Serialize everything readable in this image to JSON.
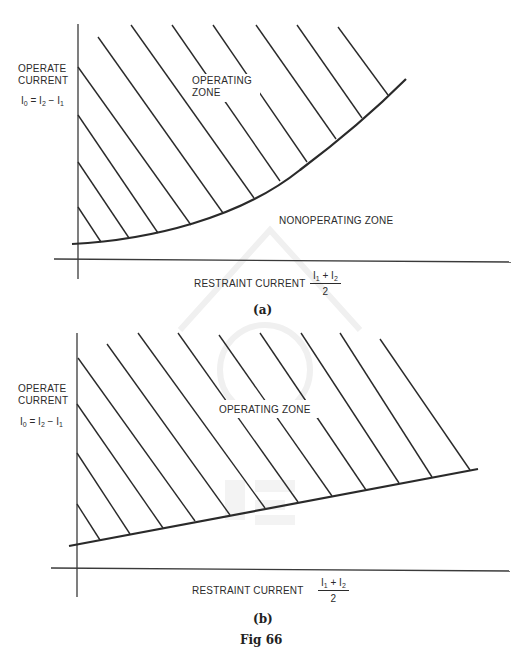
{
  "figure": {
    "caption": "Fig 66",
    "panels": [
      {
        "id": "a",
        "label": "(a)",
        "y_axis_label_line1": "OPERATE",
        "y_axis_label_line2": "CURRENT",
        "y_eq": {
          "lhs": "I",
          "lhs_sub": "0",
          "mid": " = I",
          "mid_sub": "2",
          "rhs": " − I",
          "rhs_sub": "1"
        },
        "x_axis_label": "RESTRAINT CURRENT",
        "x_frac": {
          "a": "I",
          "a_sub": "1",
          "op": " + I",
          "b_sub": "2",
          "den": "2"
        },
        "zone_label_line1": "OPERATING",
        "zone_label_line2": "ZONE",
        "non_zone_label": "NONOPERATING ZONE",
        "boundary_type": "curve"
      },
      {
        "id": "b",
        "label": "(b)",
        "y_axis_label_line1": "OPERATE",
        "y_axis_label_line2": "CURRENT",
        "y_eq": {
          "lhs": "I",
          "lhs_sub": "0",
          "mid": " = I",
          "mid_sub": "2",
          "rhs": " − I",
          "rhs_sub": "1"
        },
        "x_axis_label": "RESTRAINT CURRENT",
        "x_frac": {
          "a": "I",
          "a_sub": "1",
          "op": " + I",
          "b_sub": "2",
          "den": "2"
        },
        "zone_label": "OPERATING ZONE",
        "boundary_type": "straight line"
      }
    ]
  },
  "geometry": {
    "a": {
      "y_axis": [
        78,
        24,
        78,
        279
      ],
      "x_axis": [
        54,
        259,
        511,
        262
      ],
      "boundary_path": "M72,244 C150,240 240,218 300,170 C340,140 375,110 406,79",
      "hatch": [
        [
          78,
          207,
          101,
          242
        ],
        [
          78,
          162,
          129,
          238
        ],
        [
          78,
          115,
          158,
          233
        ],
        [
          78,
          67,
          191,
          225
        ],
        [
          98,
          37,
          223,
          213
        ],
        [
          131,
          25,
          254,
          198
        ],
        [
          172,
          25,
          280,
          181
        ],
        [
          213,
          25,
          307,
          162
        ],
        [
          256,
          25,
          336,
          139
        ],
        [
          297,
          25,
          362,
          118
        ],
        [
          338,
          27,
          388,
          95
        ]
      ],
      "hatch_gaps": [
        [
          [
            172,
            25,
            280,
            181
          ],
          [
            206,
            72,
            228,
            104
          ]
        ],
        [
          [
            213,
            25,
            307,
            162
          ],
          [
            208,
            31,
            228,
            60
          ]
        ]
      ]
    },
    "b": {
      "y_axis": [
        77,
        333,
        77,
        597
      ],
      "x_axis": [
        51,
        568,
        510,
        571
      ],
      "boundary": [
        69,
        546,
        478,
        469
      ],
      "hatch": [
        [
          77,
          504,
          100,
          540
        ],
        [
          77,
          453,
          130,
          534
        ],
        [
          77,
          404,
          163,
          528
        ],
        [
          78,
          358,
          195,
          521
        ],
        [
          107,
          344,
          230,
          515
        ],
        [
          138,
          333,
          265,
          508
        ],
        [
          178,
          333,
          298,
          502
        ],
        [
          219,
          335,
          332,
          496
        ],
        [
          260,
          333,
          366,
          490
        ],
        [
          301,
          333,
          399,
          483
        ],
        [
          340,
          333,
          432,
          477
        ],
        [
          380,
          339,
          470,
          470
        ]
      ]
    }
  },
  "colors": {
    "ink": "#2a2a2a",
    "axis": "#3a3a3a",
    "watermark": "#f1f1f1"
  }
}
